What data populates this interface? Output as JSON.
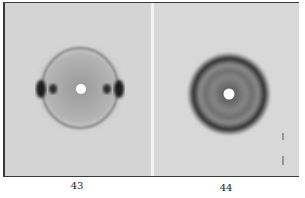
{
  "figure": {
    "panels": [
      {
        "label": "43",
        "description": "X-ray diffraction pattern with equatorial reflections and faint ring"
      },
      {
        "label": "44",
        "description": "X-ray diffraction pattern with concentric diffuse rings"
      }
    ],
    "colors": {
      "background": "#d6d6d6",
      "spots": "#1e1e1e",
      "frame": "#3a3a3a"
    }
  }
}
